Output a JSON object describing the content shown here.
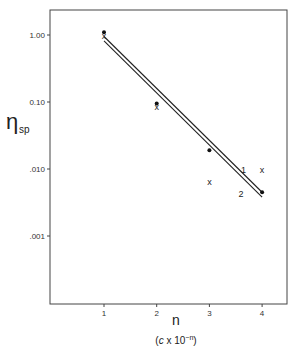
{
  "chart_data": {
    "type": "scatter",
    "title": "",
    "xlabel": "n",
    "xlabel_sub": "(c x 10^-n)",
    "ylabel": "η",
    "ylabel_sub": "sp",
    "yscale": "log",
    "xlim": [
      0,
      4.4
    ],
    "ylim": [
      0.0001,
      3.0
    ],
    "grid": false,
    "x_ticks": [
      1,
      2,
      3,
      4
    ],
    "x_tick_labels": [
      "1",
      "2",
      "3",
      "4"
    ],
    "y_ticks": [
      1.0,
      0.1,
      0.01,
      0.001
    ],
    "y_tick_labels": [
      "1.00",
      "0.10",
      ".010",
      ".001"
    ],
    "series": [
      {
        "name": "dots",
        "marker": "•",
        "x": [
          1,
          2,
          3,
          4
        ],
        "y": [
          1.1,
          0.095,
          0.019,
          0.0045
        ]
      },
      {
        "name": "crosses",
        "marker": "x",
        "x": [
          1,
          2,
          3,
          4
        ],
        "y": [
          0.95,
          0.085,
          0.0065,
          0.0095
        ]
      }
    ],
    "lines": [
      {
        "name": "1",
        "x": [
          1,
          4
        ],
        "y": [
          0.95,
          0.0045
        ]
      },
      {
        "name": "2",
        "x": [
          1,
          4
        ],
        "y": [
          0.82,
          0.0038
        ]
      }
    ],
    "annotations": [
      {
        "text": "1",
        "x": 3.6,
        "y": 0.0095
      },
      {
        "text": "2",
        "x": 3.55,
        "y": 0.0042
      }
    ]
  }
}
